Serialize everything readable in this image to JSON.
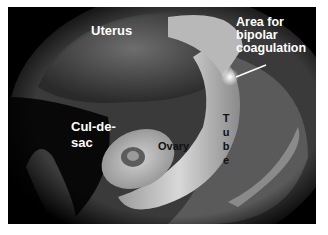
{
  "image": {
    "description": "Grayscale laparoscopic view of pelvic anatomy with labels",
    "labels": {
      "uterus": "Uterus",
      "area_line1": "Area for",
      "area_line2": "bipolar",
      "area_line3": "coagulation",
      "cul_line1": "Cul-de-",
      "cul_line2": "sac",
      "ovary": "Ovary",
      "tube": "Tube"
    },
    "colors": {
      "background": "#000000",
      "label_light": "#ffffff",
      "label_dark": "#111111"
    }
  }
}
